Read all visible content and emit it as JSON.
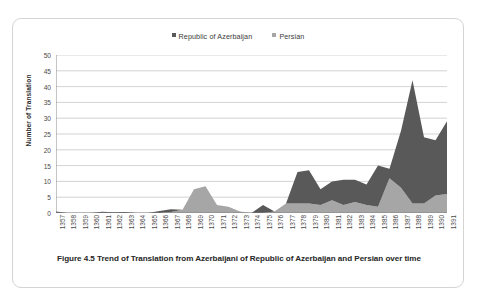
{
  "figure": {
    "caption": "Figure 4.5 Trend of Translation from Azerbaijani of Republic of Azerbaijan and Persian over time"
  },
  "colors": {
    "series_azerbaijan": "#595959",
    "series_persian": "#a6a6a6",
    "gridline": "#c8c8c8",
    "axis": "#808080",
    "frame": "#d4d4d4",
    "text": "#404040"
  },
  "chart_data": {
    "type": "area",
    "stacked": true,
    "title": "Figure 4.5 Trend of Translation from Azerbaijani of Republic of Azerbaijan and Persian over time",
    "xlabel": "",
    "ylabel": "Number of Translation",
    "ylim": [
      0,
      50
    ],
    "ytick_step": 5,
    "yticks": [
      50,
      45,
      40,
      35,
      30,
      25,
      20,
      15,
      10,
      5,
      0
    ],
    "grid": true,
    "legend_position": "top-center",
    "categories": [
      "1357",
      "1358",
      "1359",
      "1360",
      "1361",
      "1362",
      "1363",
      "1364",
      "1365",
      "1366",
      "1367",
      "1368",
      "1369",
      "1370",
      "1371",
      "1372",
      "1373",
      "1374",
      "1375",
      "1376",
      "1377",
      "1378",
      "1379",
      "1380",
      "1381",
      "1382",
      "1383",
      "1384",
      "1385",
      "1386",
      "1387",
      "1388",
      "1389",
      "1390",
      "1391"
    ],
    "series": [
      {
        "name": "Republic of Azerbaijan",
        "color": "#595959",
        "values": [
          0.5,
          0,
          0,
          0,
          0.4,
          0.2,
          0.3,
          0,
          0,
          0.6,
          0.9,
          0,
          0,
          0,
          0,
          0,
          0,
          0,
          2.5,
          0,
          0,
          10,
          10.5,
          5,
          6,
          8,
          7,
          6.5,
          13,
          3,
          18,
          39,
          21,
          17.5,
          23
        ]
      },
      {
        "name": "Persian",
        "color": "#a6a6a6",
        "values": [
          0,
          0,
          0,
          0,
          0,
          0,
          0,
          0,
          0,
          0,
          0.3,
          1,
          7.5,
          8.5,
          2.5,
          2,
          0.5,
          0,
          0,
          0.5,
          3,
          3,
          3,
          2.5,
          4,
          2.5,
          3.5,
          2.5,
          2,
          11,
          8,
          3,
          3,
          5.5,
          6
        ]
      }
    ]
  },
  "legend": {
    "entries": [
      {
        "label": "Republic of Azerbaijan",
        "color": "#595959"
      },
      {
        "label": "Persian",
        "color": "#a6a6a6"
      }
    ]
  }
}
